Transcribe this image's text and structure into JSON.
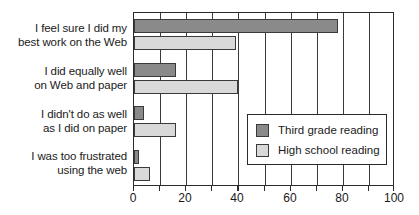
{
  "chart_data": {
    "type": "bar",
    "orientation": "horizontal",
    "title": "",
    "subtitle": "",
    "xlabel": "",
    "ylabel": "",
    "xlim": [
      0,
      100
    ],
    "xticks": [
      0,
      10,
      20,
      30,
      40,
      50,
      60,
      70,
      80,
      90,
      100
    ],
    "xtick_labels": [
      "0",
      "20",
      "40",
      "60",
      "80",
      "100"
    ],
    "labeled_xticks": [
      0,
      20,
      40,
      60,
      80,
      100
    ],
    "grid": "vertical",
    "legend_position": "center-right",
    "categories": [
      "I feel sure I did my best work on the Web",
      "I did equally well on Web and paper",
      "I didn't do as well as I did on paper",
      "I was too frustrated using the web"
    ],
    "category_lines": [
      [
        "I feel sure I did my",
        "best work on the Web"
      ],
      [
        "I did equally well",
        "on Web and paper"
      ],
      [
        "I didn't do as well",
        "as I did on paper"
      ],
      [
        "I was too frustrated",
        "using the web"
      ]
    ],
    "series": [
      {
        "name": "Third grade reading",
        "color": "#8a8a8a",
        "values": [
          78,
          16,
          4,
          2
        ]
      },
      {
        "name": "High school reading",
        "color": "#d9d9d9",
        "values": [
          39,
          40,
          16,
          6
        ]
      }
    ]
  },
  "legend": {
    "entries": [
      {
        "label": "Third grade reading",
        "color": "#8a8a8a"
      },
      {
        "label": "High school reading",
        "color": "#d9d9d9"
      }
    ]
  },
  "axis": {
    "x_tick_labels": [
      "0",
      "20",
      "40",
      "60",
      "80",
      "100"
    ]
  },
  "colors": {
    "dark_series": "#8a8a8a",
    "light_series": "#d9d9d9",
    "axis": "#2b2b2b",
    "grid": "#3a3a3a",
    "text": "#1a1a1a",
    "background": "#ffffff"
  }
}
